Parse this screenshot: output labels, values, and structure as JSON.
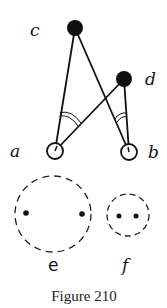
{
  "figure": {
    "caption": "Figure 210",
    "nodes": [
      {
        "id": "c",
        "label": "c",
        "x": 75,
        "y": 28,
        "r": 8,
        "filled": true
      },
      {
        "id": "d",
        "label": "d",
        "x": 124,
        "y": 79,
        "r": 8,
        "filled": true
      },
      {
        "id": "a",
        "label": "a",
        "x": 55,
        "y": 151,
        "r": 8,
        "filled": false
      },
      {
        "id": "b",
        "label": "b",
        "x": 129,
        "y": 152,
        "r": 8,
        "filled": false
      }
    ],
    "edges": [
      {
        "from": "c",
        "to": "a"
      },
      {
        "from": "c",
        "to": "b"
      },
      {
        "from": "d",
        "to": "a"
      },
      {
        "from": "d",
        "to": "b"
      }
    ],
    "angle_marks": [
      {
        "at": "a",
        "between": [
          "c",
          "d"
        ],
        "arcs": 2
      },
      {
        "at": "b",
        "between": [
          "d",
          "c"
        ],
        "arcs": 2
      }
    ],
    "groups": [
      {
        "id": "e",
        "label": "e",
        "cx": 53,
        "cy": 214,
        "r": 38,
        "dashed": true,
        "dots": [
          [
            26,
            213
          ],
          [
            82,
            214
          ]
        ]
      },
      {
        "id": "f",
        "label": "f",
        "cx": 128,
        "cy": 215,
        "r": 21,
        "dashed": true,
        "dots": [
          [
            119,
            216
          ],
          [
            136,
            216
          ]
        ]
      }
    ],
    "labels": {
      "a": "a",
      "b": "b",
      "c": "c",
      "d": "d",
      "e": "e",
      "f": "f"
    }
  }
}
